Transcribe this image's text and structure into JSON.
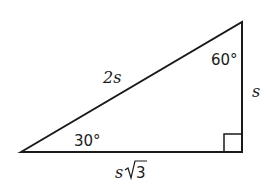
{
  "diagram": {
    "type": "right-triangle",
    "vertices": {
      "left": {
        "x": 21,
        "y": 152,
        "angle": "30°"
      },
      "top_right": {
        "x": 242,
        "y": 22,
        "angle": "60°"
      },
      "bottom_right": {
        "x": 242,
        "y": 152,
        "angle": "90°"
      }
    },
    "labels": {
      "hypotenuse": "2s",
      "vertical_leg": "s",
      "horizontal_leg_var": "s",
      "horizontal_leg_radicand": "3",
      "angle_left": "30°",
      "angle_top": "60°"
    },
    "colors": {
      "stroke": "#1a1a1a",
      "background": "#ffffff"
    }
  }
}
